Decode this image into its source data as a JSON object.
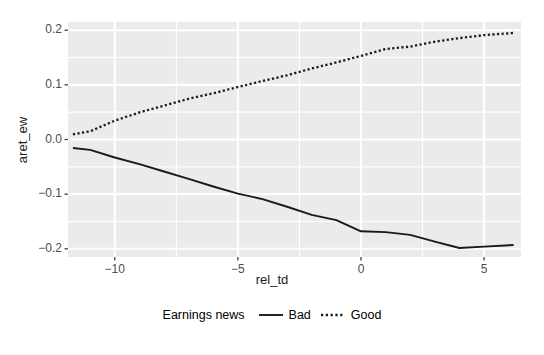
{
  "chart_data": {
    "type": "line",
    "title": "",
    "subtitle": "",
    "xlabel": "rel_td",
    "ylabel": "aret_ew",
    "xlim": [
      -11.9,
      6.5
    ],
    "ylim": [
      -0.215,
      0.215
    ],
    "xticks": [
      -10,
      -5,
      0,
      5
    ],
    "xticklabels": [
      "−10",
      "−5",
      "0",
      "5"
    ],
    "yticks": [
      -0.2,
      -0.1,
      0.0,
      0.1,
      0.2
    ],
    "yticklabels": [
      "−0.2",
      "−0.1",
      "0.0",
      "0.1",
      "0.2"
    ],
    "grid": true,
    "grid_color": "#ffffff",
    "panel_background": "#ebebeb",
    "legend": {
      "title": "Earnings news",
      "position": "bottom",
      "entries": [
        {
          "name": "Bad",
          "linestyle": "solid",
          "color": "#1a1a1a"
        },
        {
          "name": "Good",
          "linestyle": "dotted",
          "color": "#1a1a1a"
        }
      ]
    },
    "x": [
      -11.7,
      -11,
      -10,
      -9,
      -8,
      -7,
      -6,
      -5,
      -4,
      -3,
      -2,
      -1,
      0,
      1,
      2,
      3,
      4,
      5,
      6.2
    ],
    "series": [
      {
        "name": "Bad",
        "linestyle": "solid",
        "color": "#1a1a1a",
        "values": [
          -0.0155,
          -0.019,
          -0.033,
          -0.045,
          -0.0585,
          -0.072,
          -0.086,
          -0.099,
          -0.109,
          -0.123,
          -0.138,
          -0.1475,
          -0.168,
          -0.1695,
          -0.1745,
          -0.187,
          -0.1985,
          -0.196,
          -0.193
        ]
      },
      {
        "name": "Good",
        "linestyle": "dotted",
        "color": "#1a1a1a",
        "values": [
          0.0095,
          0.015,
          0.0345,
          0.0495,
          0.062,
          0.0745,
          0.0845,
          0.096,
          0.107,
          0.1175,
          0.13,
          0.141,
          0.153,
          0.1655,
          0.17,
          0.179,
          0.1855,
          0.191,
          0.195
        ]
      }
    ]
  }
}
